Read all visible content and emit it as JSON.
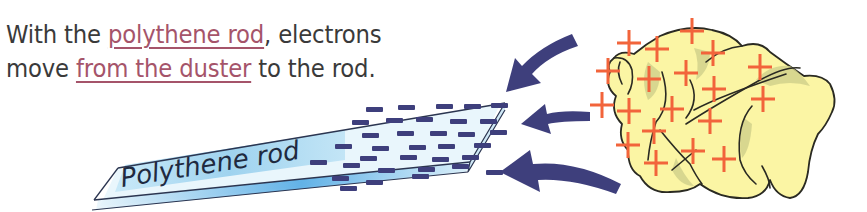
{
  "caption": {
    "line1": {
      "before": "With the ",
      "highlight": "polythene rod",
      "after": ", electrons"
    },
    "line2": {
      "before": "move ",
      "highlight": "from the duster",
      "after": " to the rod."
    }
  },
  "rod": {
    "label": "Polythene rod",
    "charge_symbol": "−",
    "charge_sign": "negative"
  },
  "duster": {
    "charge_symbol": "+",
    "charge_sign": "positive"
  },
  "arrows": {
    "count": 3,
    "direction": "left (from duster to rod)"
  },
  "colors": {
    "text": "#3a3a3a",
    "highlight": "#a5546a",
    "rod_fill": "#e6f4fb",
    "rod_band": "#a9d8f1",
    "rod_outline": "#2b3550",
    "electron": "#3e3f7c",
    "arrow": "#3e3f7c",
    "duster_fill": "#fbf5a4",
    "duster_shade": "#cfcf8a",
    "duster_outline": "#2a2a22",
    "proton": "#f2643b"
  }
}
